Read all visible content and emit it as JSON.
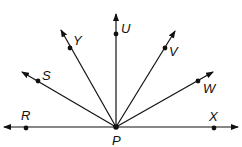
{
  "diagram": {
    "type": "rays-from-point",
    "vertex": {
      "name": "P",
      "x": 116,
      "y": 127,
      "label_x": 112,
      "label_y": 145
    },
    "line": {
      "from": "R",
      "to": "X",
      "x1": 4,
      "x2": 238,
      "y": 127
    },
    "points": [
      {
        "name": "R",
        "x": 26,
        "y": 128,
        "label_x": 21,
        "label_y": 120
      },
      {
        "name": "X",
        "x": 214,
        "y": 128,
        "label_x": 209,
        "label_y": 121
      },
      {
        "name": "S",
        "x": 38,
        "y": 81,
        "label_x": 42,
        "label_y": 80,
        "tip_x": 22,
        "tip_y": 72
      },
      {
        "name": "Y",
        "x": 70,
        "y": 48,
        "label_x": 73,
        "label_y": 45,
        "tip_x": 61,
        "tip_y": 30
      },
      {
        "name": "U",
        "x": 116,
        "y": 34,
        "label_x": 121,
        "label_y": 33,
        "tip_x": 116,
        "tip_y": 14
      },
      {
        "name": "V",
        "x": 165,
        "y": 48,
        "label_x": 169,
        "label_y": 56,
        "tip_x": 175,
        "tip_y": 31
      },
      {
        "name": "W",
        "x": 198,
        "y": 81,
        "label_x": 203,
        "label_y": 93,
        "tip_x": 213,
        "tip_y": 72
      }
    ],
    "stroke_color": "#111111"
  }
}
